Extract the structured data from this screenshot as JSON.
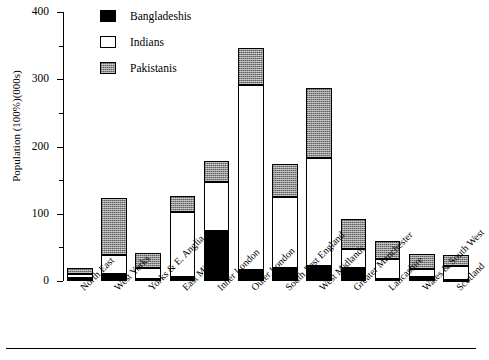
{
  "chart_data": {
    "type": "bar",
    "subtype": "stacked-vertical",
    "title": "",
    "xlabel": "",
    "ylabel": "Population (100%)(000s)",
    "ylim": [
      0,
      400
    ],
    "ytick_labels": [
      "0",
      "100",
      "200",
      "300",
      "400"
    ],
    "ytick_values": [
      0,
      100,
      200,
      300,
      400
    ],
    "yminor_tick_values": [
      50,
      150,
      250,
      350
    ],
    "grid": false,
    "legend_position": "top-left-inside",
    "categories": [
      "North East",
      "West Yorks",
      "Yorks & E. Anglia",
      "East Midlands",
      "Inner London",
      "Outer London",
      "South East England",
      "West Midlands",
      "Greater Manchester",
      "Lancashire",
      "Wales & South West",
      "Scotland"
    ],
    "series": [
      {
        "name": "Bangladeshis",
        "color": "#000000",
        "pattern": "solid-black",
        "values": [
          4,
          10,
          3,
          6,
          74,
          16,
          19,
          22,
          19,
          3,
          6,
          2
        ]
      },
      {
        "name": "Indians",
        "color": "#ffffff",
        "pattern": "open-white",
        "values": [
          6,
          29,
          16,
          96,
          73,
          275,
          106,
          161,
          29,
          30,
          12,
          20
        ]
      },
      {
        "name": "Pakistanis",
        "color": "#8f8f8f",
        "pattern": "stippled-grey",
        "values": [
          9,
          84,
          23,
          24,
          31,
          56,
          49,
          104,
          44,
          27,
          22,
          17
        ]
      }
    ],
    "totals": [
      19,
      123,
      42,
      126,
      178,
      347,
      174,
      287,
      92,
      60,
      40,
      39
    ]
  },
  "legend": {
    "entries": [
      {
        "label": "Bangladeshis",
        "swatch": "black-filled-swatch"
      },
      {
        "label": "Indians",
        "swatch": "white-open-swatch"
      },
      {
        "label": "Pakistanis",
        "swatch": "grey-stipple-swatch"
      }
    ]
  },
  "axes": {
    "y_axis_title": "Population (100%)(000s)"
  }
}
